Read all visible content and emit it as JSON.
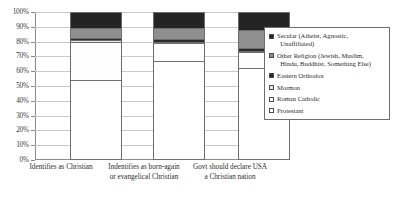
{
  "chart_data": {
    "type": "bar",
    "subtype": "stacked-100-percent",
    "title": "",
    "xlabel": "",
    "ylabel": "",
    "ylim": [
      0,
      100
    ],
    "ytick_labels": [
      "100%",
      "90%",
      "80%",
      "70%",
      "60%",
      "50%",
      "40%",
      "30%",
      "20%",
      "10%",
      "0%"
    ],
    "ytick_values": [
      100,
      90,
      80,
      70,
      60,
      50,
      40,
      30,
      20,
      10,
      0
    ],
    "grid": true,
    "legend_position": "right",
    "categories": [
      "Identifies as Christian",
      "Indentifies as born-again or evangelical Christian",
      "Govt should declare USA a Christian nation"
    ],
    "series": [
      {
        "name": "Protestant",
        "values": [
          54.0,
          67.0,
          62.0
        ],
        "color": "#ffffff"
      },
      {
        "name": "Roman Catholic",
        "values": [
          26.0,
          12.0,
          11.0
        ],
        "color": "#fdfdfd"
      },
      {
        "name": "Mormon",
        "values": [
          1.0,
          1.0,
          1.0
        ],
        "color": "#e8e8e8"
      },
      {
        "name": "Eastern Orthodox",
        "values": [
          1.5,
          1.5,
          1.5
        ],
        "color": "#2a2a2a"
      },
      {
        "name": "Other Religion (Jewish, Muslim, Hindu, Buddhist, Something Else)",
        "values": [
          6.5,
          7.5,
          12.5
        ],
        "color": "#8f8f8f"
      },
      {
        "name": "Secular (Atheist, Agnostic, Unaffiliated)",
        "values": [
          11.0,
          11.0,
          12.0
        ],
        "color": "#242424"
      }
    ]
  },
  "axis": {
    "y": {
      "t100": "100%",
      "t90": "90%",
      "t80": "80%",
      "t70": "70%",
      "t60": "60%",
      "t50": "50%",
      "t40": "40%",
      "t30": "30%",
      "t20": "20%",
      "t10": "10%",
      "t0": "0%"
    },
    "x": {
      "cat1": "Identifies as Christian",
      "cat2_line1": "Indentifies as born-again",
      "cat2_line2": "or evangelical Christian",
      "cat3_line1": "Govt should declare USA",
      "cat3_line2": "a Christian nation"
    }
  },
  "legend": {
    "items": [
      {
        "label_line1": "Secular (Atheist, Agnostic,",
        "label_line2": "Unaffiliated)",
        "swatch": "#242424"
      },
      {
        "label_line1": "Other Religion (Jewish, Muslim,",
        "label_line2": "Hindu, Buddhist, Something Else)",
        "swatch": "#8f8f8f"
      },
      {
        "label_line1": "Eastern Orthodox",
        "label_line2": "",
        "swatch": "#2a2a2a"
      },
      {
        "label_line1": "Mormon",
        "label_line2": "",
        "swatch": "#e8e8e8"
      },
      {
        "label_line1": "Roman Catholic",
        "label_line2": "",
        "swatch": "#fdfdfd"
      },
      {
        "label_line1": "Protestant",
        "label_line2": "",
        "swatch": "#ffffff"
      }
    ]
  }
}
